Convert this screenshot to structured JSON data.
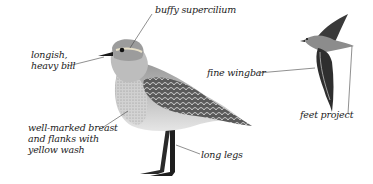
{
  "figure": {
    "background": "#ffffff",
    "ink_color": "#222222"
  },
  "labels": {
    "bill": [
      "longish,",
      "heavy bill"
    ],
    "supercilium": "buffy supercilium",
    "breast": [
      "well-marked breast",
      "and flanks with",
      "yellow wash"
    ],
    "legs": "long legs",
    "wingbar": "fine wingbar",
    "feet": "feet project"
  }
}
